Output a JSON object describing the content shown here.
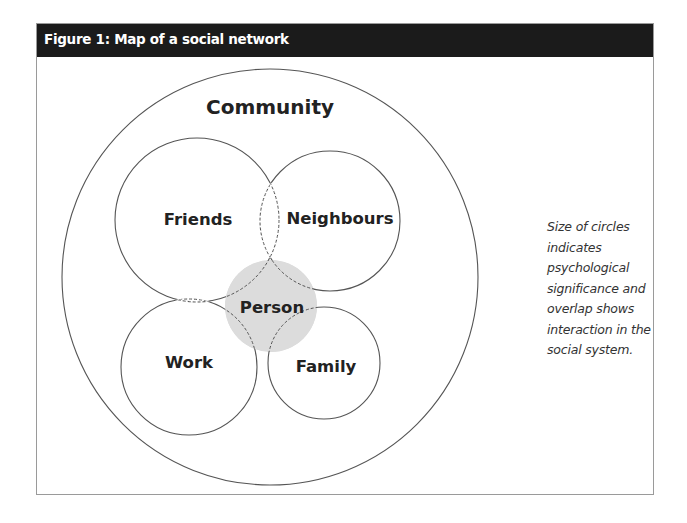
{
  "figure": {
    "title": "Figure 1:  Map of a social network",
    "caption": "Size of circles indicates psychological significance and overlap shows interaction in the social system."
  },
  "diagram": {
    "outer": {
      "label": "Community"
    },
    "circles": [
      {
        "id": "friends",
        "label": "Friends"
      },
      {
        "id": "neighbours",
        "label": "Neighbours"
      },
      {
        "id": "work",
        "label": "Work"
      },
      {
        "id": "family",
        "label": "Family"
      },
      {
        "id": "person",
        "label": "Person"
      }
    ],
    "colors": {
      "header_bg": "#1b1b1b",
      "header_text": "#ffffff",
      "line": "#555555",
      "person_fill": "#dcdcdc"
    }
  }
}
